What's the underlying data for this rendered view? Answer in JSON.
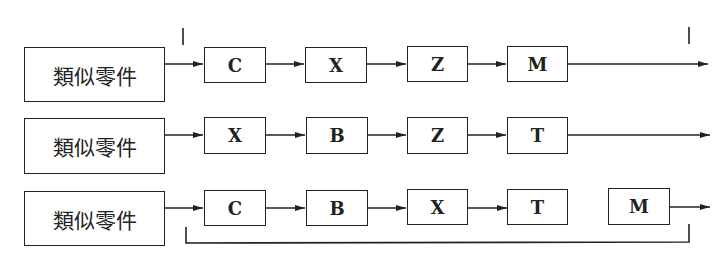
{
  "diagram": {
    "type": "process-flow",
    "rows": [
      {
        "group_label": "類似零件",
        "operations": [
          "C",
          "X",
          "Z",
          "M"
        ]
      },
      {
        "group_label": "類似零件",
        "operations": [
          "X",
          "B",
          "Z",
          "T"
        ]
      },
      {
        "group_label": "類似零件",
        "operations": [
          "C",
          "B",
          "X",
          "T",
          "M"
        ]
      }
    ],
    "markers": {
      "top_range_ticks": true,
      "bottom_bracket": true
    },
    "colors": {
      "line": "#222222",
      "background": "#ffffff"
    }
  }
}
